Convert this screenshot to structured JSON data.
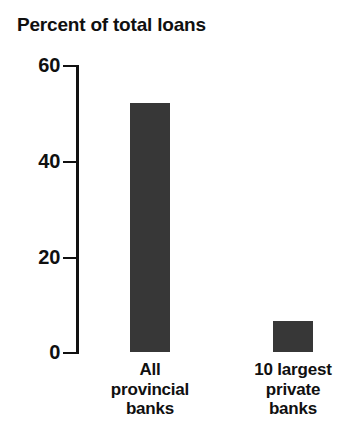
{
  "chart_data": {
    "type": "bar",
    "title": "Percent of total loans",
    "xlabel": "",
    "ylabel": "",
    "categories": [
      "All provincial banks",
      "10 largest private banks"
    ],
    "category_lines": [
      [
        "All",
        "provincial",
        "banks"
      ],
      [
        "10 largest",
        "private",
        "banks"
      ]
    ],
    "values": [
      52,
      6.5
    ],
    "ylim": [
      0,
      60
    ],
    "yticks": [
      0,
      20,
      40,
      60
    ],
    "ytick_labels": [
      "0",
      "20",
      "40",
      "60"
    ],
    "grid": false,
    "legend": null,
    "colors": {
      "bar": "#373737",
      "axis": "#111111",
      "text": "#101010",
      "background": "#ffffff"
    }
  },
  "axis": {
    "tick_0": "0",
    "tick_20": "20",
    "tick_40": "40",
    "tick_60": "60"
  },
  "bars": {
    "bar0_label": "All provincial banks",
    "bar1_label": "10 largest private banks"
  },
  "labels": {
    "cat0_line0": "All",
    "cat0_line1": "provincial",
    "cat0_line2": "banks",
    "cat1_line0": "10 largest",
    "cat1_line1": "private",
    "cat1_line2": "banks"
  }
}
